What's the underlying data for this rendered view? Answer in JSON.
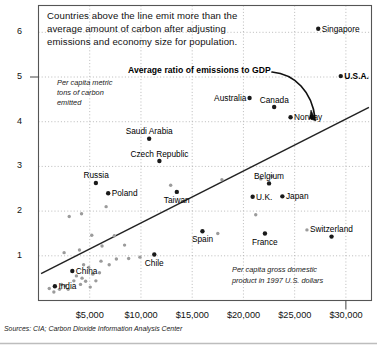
{
  "figure": {
    "headline": [
      "Countries above the line emit more than the",
      "average amount of carbon after adjusting",
      "emissions and economy size for population."
    ],
    "annotation_trendline": "Average ratio of emissions to GDP",
    "y_axis_caption": [
      "Per capita metric",
      "tons of carbon",
      "emitted"
    ],
    "x_axis_caption": [
      "Per capita gross domestic",
      "product in 1997 U.S. dollars"
    ],
    "source": "Sources: CIA; Carbon Dioxide Information Analysis Center",
    "colors": {
      "frame": "#555555",
      "grid": "#aaaaaa",
      "trendline": "#222222",
      "point_labeled": "#1a1a1a",
      "point_unlabeled": "#9b9b9b",
      "text": "#111111",
      "background": "#ffffff"
    }
  },
  "chart_data": {
    "type": "scatter",
    "title": "Countries above the line emit more than the average amount of carbon after adjusting emissions and economy size for population.",
    "xlabel": "Per capita gross domestic product in 1997 U.S. dollars",
    "ylabel": "Per capita metric tons of carbon emitted",
    "xlim": [
      0,
      32500
    ],
    "ylim": [
      0,
      6.6
    ],
    "grid": "dotted",
    "legend": "none",
    "x_ticks": [
      5000,
      10000,
      15000,
      20000,
      25000,
      30000
    ],
    "x_tick_labels": [
      "$5,000",
      "$10,000",
      "$15,000",
      "$20,000",
      "$25,000",
      "$30,000"
    ],
    "y_ticks": [
      1,
      2,
      3,
      4,
      5,
      6
    ],
    "y_tick_labels": [
      "1",
      "2",
      "3",
      "4",
      "5",
      "6"
    ],
    "trendline": {
      "label": "Average ratio of emissions to GDP",
      "x0": 250,
      "y0": 0.6,
      "x1": 32250,
      "y1": 4.32
    },
    "labeled_points": [
      {
        "name": "Singapore",
        "x": 27300,
        "y": 6.08,
        "label_side": "right"
      },
      {
        "name": "U.S.A.",
        "x": 29500,
        "y": 5.02,
        "label_side": "right",
        "bold": true
      },
      {
        "name": "Australia",
        "x": 20600,
        "y": 4.53,
        "label_side": "left"
      },
      {
        "name": "Canada",
        "x": 23000,
        "y": 4.33,
        "label_side": "above"
      },
      {
        "name": "Norway",
        "x": 24600,
        "y": 4.1,
        "label_side": "right"
      },
      {
        "name": "Saudi Arabia",
        "x": 10800,
        "y": 3.62,
        "label_side": "above"
      },
      {
        "name": "Czech Republic",
        "x": 11800,
        "y": 3.12,
        "label_side": "above"
      },
      {
        "name": "Russia",
        "x": 5600,
        "y": 2.63,
        "label_side": "above"
      },
      {
        "name": "Belgium",
        "x": 22500,
        "y": 2.62,
        "label_side": "above"
      },
      {
        "name": "Poland",
        "x": 6800,
        "y": 2.4,
        "label_side": "right"
      },
      {
        "name": "Taiwan",
        "x": 13500,
        "y": 2.43,
        "label_side": "below"
      },
      {
        "name": "Japan",
        "x": 23800,
        "y": 2.33,
        "label_side": "right"
      },
      {
        "name": "U.K.",
        "x": 20900,
        "y": 2.32,
        "label_side": "right"
      },
      {
        "name": "Switzerland",
        "x": 28600,
        "y": 1.43,
        "label_side": "above"
      },
      {
        "name": "Spain",
        "x": 16000,
        "y": 1.55,
        "label_side": "below"
      },
      {
        "name": "France",
        "x": 22100,
        "y": 1.5,
        "label_side": "below"
      },
      {
        "name": "Chile",
        "x": 11300,
        "y": 1.03,
        "label_side": "below"
      },
      {
        "name": "China",
        "x": 3300,
        "y": 0.66,
        "label_side": "right"
      },
      {
        "name": "India",
        "x": 1600,
        "y": 0.32,
        "label_side": "right"
      }
    ],
    "unlabeled_points": [
      {
        "x": 1050,
        "y": 0.27
      },
      {
        "x": 1500,
        "y": 0.19
      },
      {
        "x": 2050,
        "y": 0.25
      },
      {
        "x": 2250,
        "y": 0.36
      },
      {
        "x": 2600,
        "y": 0.33
      },
      {
        "x": 2900,
        "y": 0.25
      },
      {
        "x": 3450,
        "y": 0.44
      },
      {
        "x": 3700,
        "y": 0.55
      },
      {
        "x": 4100,
        "y": 0.36
      },
      {
        "x": 4250,
        "y": 0.5
      },
      {
        "x": 4600,
        "y": 0.43
      },
      {
        "x": 5050,
        "y": 0.3
      },
      {
        "x": 5300,
        "y": 0.59
      },
      {
        "x": 5600,
        "y": 0.44
      },
      {
        "x": 5950,
        "y": 0.62
      },
      {
        "x": 4400,
        "y": 0.8
      },
      {
        "x": 4900,
        "y": 0.74
      },
      {
        "x": 6100,
        "y": 0.88
      },
      {
        "x": 6900,
        "y": 0.8
      },
      {
        "x": 7600,
        "y": 0.93
      },
      {
        "x": 8800,
        "y": 0.94
      },
      {
        "x": 9900,
        "y": 0.97
      },
      {
        "x": 4000,
        "y": 1.13
      },
      {
        "x": 6200,
        "y": 1.22
      },
      {
        "x": 7400,
        "y": 1.45
      },
      {
        "x": 5200,
        "y": 1.46
      },
      {
        "x": 8400,
        "y": 1.24
      },
      {
        "x": 17500,
        "y": 1.5
      },
      {
        "x": 26200,
        "y": 1.58
      },
      {
        "x": 3000,
        "y": 1.88
      },
      {
        "x": 4200,
        "y": 1.94
      },
      {
        "x": 6600,
        "y": 2.1
      },
      {
        "x": 21200,
        "y": 1.92
      },
      {
        "x": 12900,
        "y": 2.58
      },
      {
        "x": 17900,
        "y": 2.7
      },
      {
        "x": 21700,
        "y": 2.72
      },
      {
        "x": 22800,
        "y": 2.78
      },
      {
        "x": 2500,
        "y": 1.07
      }
    ]
  }
}
